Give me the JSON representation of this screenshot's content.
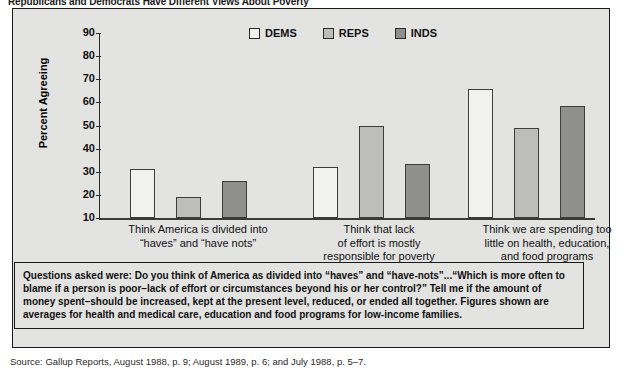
{
  "figure": {
    "title": "Republicans and Democrats Have Different Views About Poverty"
  },
  "legend": {
    "position": "top-center",
    "items": [
      {
        "label": "DEMS",
        "color": "#f2f2f0",
        "icon": "legend-swatch-icon"
      },
      {
        "label": "REPS",
        "color": "#bdbdbb",
        "icon": "legend-swatch-icon"
      },
      {
        "label": "INDS",
        "color": "#8f8f8d",
        "icon": "legend-swatch-icon"
      }
    ]
  },
  "axes": {
    "ylabel": "Percent Agreeing",
    "yticks": [
      "90",
      "80",
      "70",
      "60",
      "50",
      "40",
      "30",
      "20",
      "10"
    ]
  },
  "groups": [
    {
      "label": "Think America is divided into\n“haves” and “have nots”"
    },
    {
      "label": "Think that lack\nof effort is mostly\nresponsible for poverty"
    },
    {
      "label": "Think we are spending too\nlittle on health, education,\nand food programs"
    }
  ],
  "note": "Questions asked were:  Do you think of America as divided into “haves” and “have-nots”...“Which is more often to blame if a person is poor–lack of effort or circumstances beyond his or her control?” Tell me if the amount of money spent–should be increased, kept at the present level, reduced, or ended all together. Figures shown are averages for health and medical care, education and food programs for low-income families.",
  "source": "Source: Gallup Reports, August  1988, p. 9; August 1989, p. 6; and July 1988, p. 5–7.",
  "chart_data": {
    "type": "bar",
    "title": "Republicans and Democrats Have Different Views About Poverty",
    "xlabel": "",
    "ylabel": "Percent Agreeing",
    "ylim": [
      10,
      90
    ],
    "grid": false,
    "legend_position": "top-center",
    "categories": [
      "Think America is divided into “haves” and “have nots”",
      "Think that lack of effort is mostly responsible for poverty",
      "Think we are spending too little on health, education, and food programs"
    ],
    "series": [
      {
        "name": "DEMS",
        "color": "#f2f2f0",
        "values": [
          31,
          32,
          66
        ]
      },
      {
        "name": "REPS",
        "color": "#bdbdbb",
        "values": [
          19,
          50,
          49
        ]
      },
      {
        "name": "INDS",
        "color": "#8f8f8d",
        "values": [
          26,
          33.5,
          58.5
        ]
      }
    ]
  }
}
